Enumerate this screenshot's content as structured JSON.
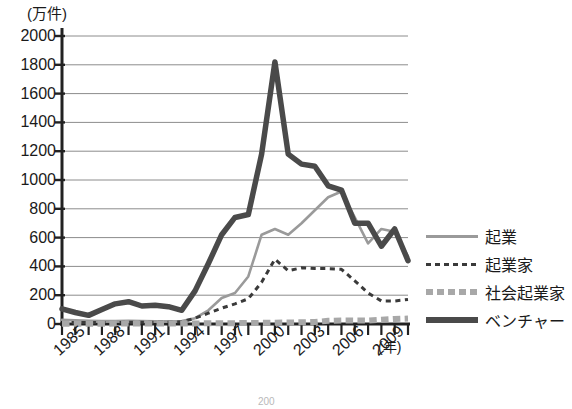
{
  "chart_data": {
    "type": "line",
    "title": "",
    "xlabel": "(年)",
    "ylabel": "(万件)",
    "unit_label": "(万件)",
    "x_axis_label": "(年)",
    "ylim": [
      0,
      2000
    ],
    "ytick_step": 200,
    "yticks": [
      0,
      200,
      400,
      600,
      800,
      1000,
      1200,
      1400,
      1600,
      1800,
      2000
    ],
    "ytick_labels": [
      "0",
      "200",
      "400",
      "600",
      "800",
      "1000",
      "1200",
      "1400",
      "1600",
      "1800",
      "2000"
    ],
    "xlim": [
      1985,
      2011
    ],
    "x": [
      1985,
      1986,
      1987,
      1988,
      1989,
      1990,
      1991,
      1992,
      1993,
      1994,
      1995,
      1996,
      1997,
      1998,
      1999,
      2000,
      2001,
      2002,
      2003,
      2004,
      2005,
      2006,
      2007,
      2008,
      2009,
      2010,
      2011
    ],
    "xtick_labels": [
      "1985",
      "1988",
      "1991",
      "1994",
      "1997",
      "2000",
      "2003",
      "2006",
      "2009"
    ],
    "xtick_label_years": [
      1985,
      1988,
      1991,
      1994,
      1997,
      2000,
      2003,
      2006,
      2009
    ],
    "xticks_minor_every": 1,
    "grid": true,
    "grid_axis": "y",
    "legend_position": "right",
    "series": [
      {
        "name": "起業",
        "style": "solid-thin",
        "color": "#9a9a9a",
        "width": 2.6,
        "values": [
          30,
          25,
          22,
          20,
          20,
          22,
          20,
          18,
          18,
          20,
          40,
          95,
          180,
          215,
          330,
          620,
          660,
          620,
          700,
          790,
          880,
          920,
          740,
          560,
          660,
          640,
          470
        ]
      },
      {
        "name": "起業家",
        "style": "dotted",
        "color": "#3a3a3a",
        "width": 3.0,
        "values": [
          10,
          10,
          10,
          10,
          10,
          12,
          12,
          12,
          12,
          15,
          40,
          75,
          110,
          140,
          175,
          290,
          450,
          370,
          390,
          385,
          385,
          380,
          300,
          215,
          160,
          160,
          170
        ]
      },
      {
        "name": "社会起業家",
        "style": "dashed-thick",
        "color": "#a8a8a8",
        "width": 6.0,
        "values": [
          2,
          2,
          2,
          2,
          3,
          3,
          3,
          3,
          3,
          3,
          4,
          5,
          6,
          6,
          7,
          8,
          9,
          10,
          12,
          14,
          22,
          24,
          24,
          24,
          30,
          35,
          38
        ]
      },
      {
        "name": "ベンチャー",
        "style": "solid-thick",
        "color": "#4a4a4a",
        "width": 5.5,
        "values": [
          105,
          80,
          60,
          100,
          140,
          155,
          125,
          130,
          120,
          95,
          230,
          420,
          620,
          740,
          760,
          1180,
          1820,
          1180,
          1110,
          1095,
          960,
          930,
          700,
          700,
          540,
          660,
          440
        ]
      }
    ]
  },
  "legend": {
    "items": [
      {
        "label": "起業"
      },
      {
        "label": "起業家"
      },
      {
        "label": "社会起業家"
      },
      {
        "label": "ベンチャー"
      }
    ]
  },
  "footer": {
    "page_number": "200"
  }
}
